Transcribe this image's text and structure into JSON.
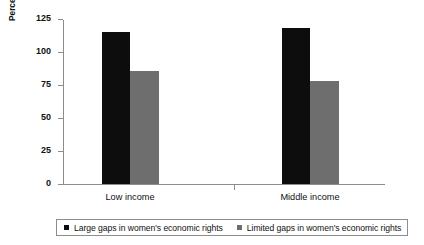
{
  "chart_data": {
    "type": "bar",
    "title": "",
    "xlabel": "",
    "ylabel": "Percentage gap between male and\nfemale employers",
    "ylabel_line1": "Percentage gap between male and",
    "ylabel_line2": "female employers",
    "categories": [
      "Low income",
      "Middle income"
    ],
    "ylim": [
      0,
      125
    ],
    "yticks": [
      0,
      25,
      50,
      75,
      100,
      125
    ],
    "ytick_labels": [
      "0",
      "25",
      "50",
      "75",
      "100",
      "125"
    ],
    "grid": false,
    "legend_position": "bottom",
    "series": [
      {
        "name": "Large gaps in women's economic rights",
        "color": "#0d0d0d",
        "values": [
          115,
          118.5
        ]
      },
      {
        "name": "Limited gaps in women's economic rights",
        "color": "#6e6e6e",
        "values": [
          85.5,
          78
        ]
      }
    ]
  },
  "colors": {
    "dark_series": "#0d0d0d",
    "light_series": "#6e6e6e",
    "axis": "#8d8d8d",
    "text": "#111111",
    "background": "#ffffff"
  }
}
